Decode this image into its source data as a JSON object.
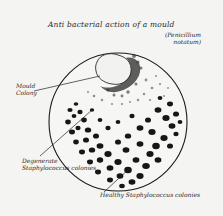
{
  "drawing": {
    "title": "Anti bacterial action of a mould",
    "subtitle_line1": "(Penicillium",
    "subtitle_line2": "notatum)",
    "labels": {
      "mould": [
        "Mould",
        "Colony"
      ],
      "lysed": [
        "Degenerate",
        "Staphylococcus colonies"
      ],
      "healthy": "Healthy Staphylococcus colonies"
    },
    "colors": {
      "paper": "#f4f4f2",
      "ink": "#1a1a1a"
    }
  }
}
